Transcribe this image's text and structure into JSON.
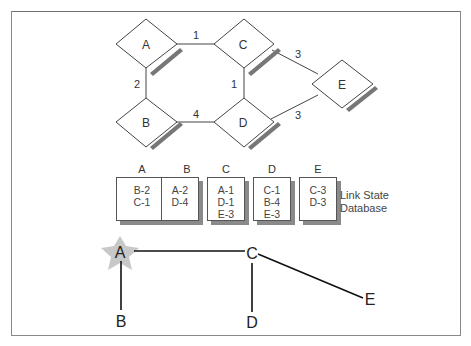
{
  "network": {
    "nodes": [
      {
        "id": "A",
        "label": "A"
      },
      {
        "id": "B",
        "label": "B"
      },
      {
        "id": "C",
        "label": "C"
      },
      {
        "id": "D",
        "label": "D"
      },
      {
        "id": "E",
        "label": "E"
      }
    ],
    "links": [
      {
        "from": "A",
        "to": "C",
        "cost": "1"
      },
      {
        "from": "A",
        "to": "B",
        "cost": "2"
      },
      {
        "from": "C",
        "to": "D",
        "cost": "1"
      },
      {
        "from": "B",
        "to": "D",
        "cost": "4"
      },
      {
        "from": "C",
        "to": "E",
        "cost": "3"
      },
      {
        "from": "D",
        "to": "E",
        "cost": "3"
      }
    ]
  },
  "database": {
    "caption_line1": "Link State",
    "caption_line2": "Database",
    "tables": [
      {
        "router": "A",
        "entries": [
          "B-2",
          "C-1"
        ]
      },
      {
        "router": "B",
        "entries": [
          "A-2",
          "D-4"
        ]
      },
      {
        "router": "C",
        "entries": [
          "A-1",
          "D-1",
          "E-3"
        ]
      },
      {
        "router": "D",
        "entries": [
          "C-1",
          "B-4",
          "E-3"
        ]
      },
      {
        "router": "E",
        "entries": [
          "C-3",
          "D-3"
        ]
      }
    ]
  },
  "tree": {
    "root": "A",
    "nodes": [
      "A",
      "B",
      "C",
      "D",
      "E"
    ],
    "edges": [
      [
        "A",
        "B"
      ],
      [
        "A",
        "C"
      ],
      [
        "C",
        "D"
      ],
      [
        "C",
        "E"
      ]
    ],
    "star_color": "#c8c8c8"
  }
}
